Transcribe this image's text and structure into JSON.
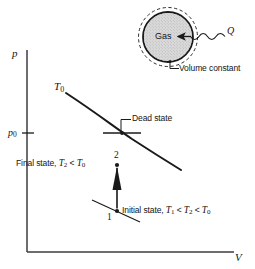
{
  "figure": {
    "type": "pressure-volume-diagram",
    "background_color": "#ffffff",
    "line_color": "#1a1a1a",
    "fill_color": "#d9d9d9",
    "axes": {
      "y_axis_label": "p",
      "x_axis_label": "V",
      "y_tick_label": "p",
      "y_tick_subscript": "0"
    },
    "curves": {
      "isotherm_label": "T",
      "isotherm_subscript": "0"
    },
    "annotations": {
      "dead_state": "Dead state",
      "final_state_prefix": "Final state, ",
      "final_state_T2": "T",
      "final_state_T2_sub": "2",
      "final_state_rel": " < ",
      "final_state_T0": "T",
      "final_state_T0_sub": "0",
      "initial_state_prefix": "Initial state, ",
      "initial_state_T1": "T",
      "initial_state_T1_sub": "1",
      "initial_state_rel1": " < ",
      "initial_state_T2": "T",
      "initial_state_T2_sub": "2",
      "initial_state_rel2": " < ",
      "initial_state_T0": "T",
      "initial_state_T0_sub": "0",
      "state_2_number": "2",
      "state_1_number": "1"
    },
    "inset": {
      "vessel_label": "Gas",
      "heat_label": "Q",
      "callout_label": "Volume constant"
    }
  }
}
